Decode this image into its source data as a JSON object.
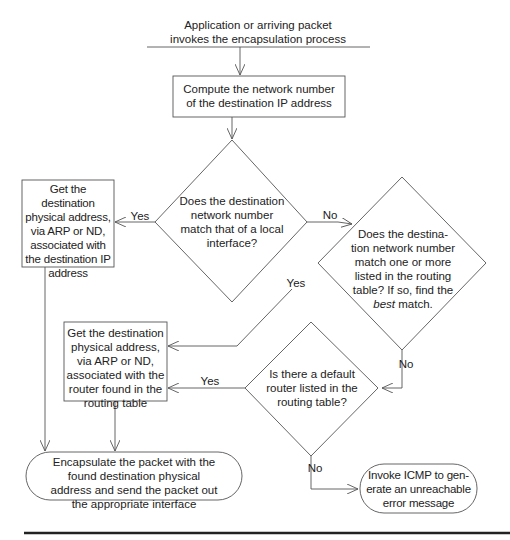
{
  "diagram": {
    "type": "flowchart",
    "nodes": {
      "start": {
        "kind": "label",
        "lines": [
          "Application or arriving packet",
          "invokes the encapsulation process"
        ]
      },
      "compute": {
        "kind": "process",
        "lines": [
          "Compute the network number",
          "of the destination IP address"
        ]
      },
      "decision_local": {
        "kind": "decision",
        "lines": [
          "Does the destination",
          "network number",
          "match that of a local",
          "interface?"
        ]
      },
      "get_local": {
        "kind": "process",
        "lines": [
          "Get the destination",
          "physical address,",
          "via ARP or ND,",
          "associated with",
          "the destination IP",
          "address"
        ]
      },
      "decision_routing": {
        "kind": "decision",
        "lines": [
          "Does the destina-",
          "tion network number",
          "match one or more",
          "listed in the routing",
          "table? If so, find the"
        ],
        "last_line_italic": "best",
        "last_line_rest": " match."
      },
      "get_router": {
        "kind": "process",
        "lines": [
          "Get the destination",
          "physical address,",
          "via ARP or ND,",
          "associated with the",
          "router found in the",
          "routing table"
        ]
      },
      "decision_default": {
        "kind": "decision",
        "lines": [
          "Is there a default",
          "router listed in the",
          "routing table?"
        ]
      },
      "encapsulate": {
        "kind": "terminal",
        "lines": [
          "Encapsulate the packet with the",
          "found destination physical",
          "address and send the packet out",
          "the appropriate interface"
        ]
      },
      "icmp": {
        "kind": "terminal",
        "lines": [
          "Invoke ICMP to gen-",
          "erate an unreachable",
          "error message"
        ]
      }
    },
    "edges": [
      {
        "from": "start",
        "to": "compute",
        "label": ""
      },
      {
        "from": "compute",
        "to": "decision_local",
        "label": ""
      },
      {
        "from": "decision_local",
        "to": "get_local",
        "label": "Yes"
      },
      {
        "from": "decision_local",
        "to": "decision_routing",
        "label": "No"
      },
      {
        "from": "decision_routing",
        "to": "get_router",
        "label": "Yes"
      },
      {
        "from": "decision_routing",
        "to": "decision_default",
        "label": "No"
      },
      {
        "from": "decision_default",
        "to": "get_router",
        "label": "Yes"
      },
      {
        "from": "decision_default",
        "to": "icmp",
        "label": "No"
      },
      {
        "from": "get_local",
        "to": "encapsulate",
        "label": ""
      },
      {
        "from": "get_router",
        "to": "encapsulate",
        "label": ""
      }
    ],
    "labels": {
      "yes": "Yes",
      "no": "No"
    }
  }
}
